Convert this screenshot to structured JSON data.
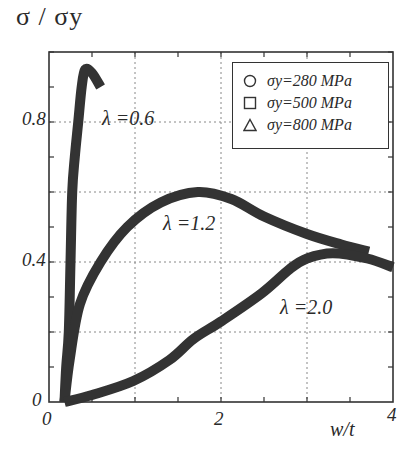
{
  "chart_data": {
    "type": "line",
    "title": "",
    "xlabel": "w/t",
    "ylabel": "σ / σy",
    "xlim": [
      0,
      4
    ],
    "ylim": [
      0,
      1.0
    ],
    "x_ticks": [
      "0",
      "2",
      "4"
    ],
    "y_ticks": [
      "0",
      "0.4",
      "0.8"
    ],
    "grid": true,
    "grid_x": [
      1,
      2,
      3
    ],
    "grid_y": [
      0.2,
      0.4,
      0.6,
      0.8
    ],
    "legend_position": "upper right",
    "legend": [
      {
        "marker": "circle",
        "label": "σy=280 MPa"
      },
      {
        "marker": "square",
        "label": "σy=500 MPa"
      },
      {
        "marker": "triangle",
        "label": "σy=800 MPa"
      }
    ],
    "series": [
      {
        "name": "λ=0.6",
        "x": [
          0.18,
          0.2,
          0.23,
          0.25,
          0.27,
          0.3,
          0.34,
          0.38,
          0.42,
          0.5,
          0.6
        ],
        "y": [
          0.0,
          0.1,
          0.2,
          0.4,
          0.6,
          0.7,
          0.8,
          0.9,
          0.95,
          0.94,
          0.9
        ]
      },
      {
        "name": "λ=1.2",
        "x": [
          0.18,
          0.24,
          0.36,
          0.6,
          0.91,
          1.3,
          1.73,
          2.12,
          2.5,
          3.0,
          3.4,
          3.72
        ],
        "y": [
          0.0,
          0.12,
          0.28,
          0.4,
          0.5,
          0.57,
          0.6,
          0.58,
          0.53,
          0.48,
          0.45,
          0.43
        ]
      },
      {
        "name": "λ=2.0",
        "x": [
          0.18,
          0.5,
          0.98,
          1.4,
          1.68,
          2.0,
          2.47,
          2.8,
          3.0,
          3.3,
          3.7,
          4.0
        ],
        "y": [
          0.0,
          0.02,
          0.06,
          0.12,
          0.18,
          0.23,
          0.31,
          0.38,
          0.41,
          0.425,
          0.41,
          0.385
        ]
      }
    ],
    "annotations": [
      {
        "text": "λ =0.6",
        "x": 0.65,
        "y": 0.8
      },
      {
        "text": "λ =1.2",
        "x": 1.35,
        "y": 0.5
      },
      {
        "text": "λ =2.0",
        "x": 2.7,
        "y": 0.26
      }
    ]
  },
  "labels": {
    "ylabel": "σ / σy",
    "xlabel": "w/t",
    "y0": "0",
    "y04": "0.4",
    "y08": "0.8",
    "x0": "0",
    "x2": "2",
    "x4": "4",
    "lam06": "λ =0.6",
    "lam12": "λ =1.2",
    "lam20": "λ =2.0",
    "legend1": "σy=280 MPa",
    "legend2": "σy=500 MPa",
    "legend3": "σy=800 MPa"
  },
  "colors": {
    "curve": "#333333",
    "frame": "#333333",
    "grid": "#777777"
  }
}
